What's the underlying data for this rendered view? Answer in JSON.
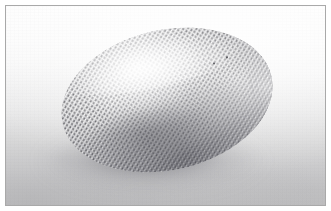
{
  "image": {
    "type": "photograph",
    "subject": "textured-egg-shaped-object",
    "subject_label": "Egg-shaped object with dense bumpy knobbed surface",
    "alt_text": "Close-up photograph of a pale ellipsoidal egg-shaped object covered in a dense regular grid of small knobs or bristles, resting on a light grey seamless backdrop and lit from the upper left.",
    "caption": "",
    "orientation": "landscape",
    "framing": "thin grey rectangular border with white outer margin"
  },
  "scene": {
    "background_label": "light grey seamless studio backdrop",
    "lighting": "diffuse light from upper left",
    "shadow_label": "soft contact shadow beneath and to the lower left of the object",
    "object_tilt_label": "long axis tilted, pointing up toward the right"
  },
  "object": {
    "shape": "ellipsoid / egg",
    "surface_label": "regular array of small raised knobs",
    "highlight_label": "broad specular highlight on the upper left of the dome",
    "tip_label": "pointed right end with scattered protruding bristle tips",
    "flecks_label": "small dark specks on the upper right surface"
  },
  "colors": {
    "frame_border": "#a9a9a9",
    "outer_margin": "#ffffff",
    "backdrop_top": "#fdfdfd",
    "backdrop_bottom": "#c8c8c9",
    "object_highlight": "#fbfbfb",
    "object_midtone": "#d4d4d5",
    "object_shadow": "#b6b6b9",
    "bump_dark": "#46464c",
    "shadow": "#5c5c62"
  },
  "dimensions": {
    "width_px": 331,
    "height_px": 211
  }
}
